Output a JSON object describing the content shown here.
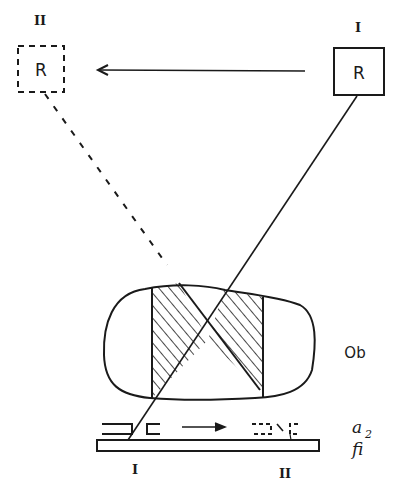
{
  "diagram": {
    "type": "schematic-drawing",
    "stroke_color": "#1a1a1a",
    "background": "#ffffff",
    "receivers": [
      {
        "id": "receiver-I",
        "position_label": "I",
        "box_label": "R",
        "border": "solid"
      },
      {
        "id": "receiver-II",
        "position_label": "II",
        "box_label": "R",
        "border": "dashed"
      }
    ],
    "movement_arrow_top": {
      "from": "I",
      "to": "II",
      "direction": "left"
    },
    "movement_arrow_bottom": {
      "direction": "right"
    },
    "object_label": "Ob",
    "aperture_label": "a",
    "aperture_subscript": "2",
    "film_label": "fi",
    "film_positions": [
      "I",
      "II"
    ],
    "hatched_regions": 2
  }
}
